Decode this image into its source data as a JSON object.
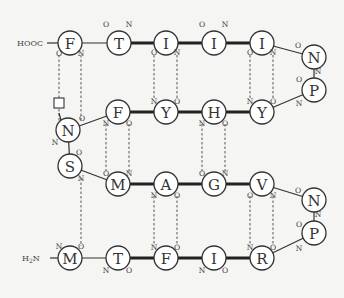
{
  "diagram": {
    "type": "beta-sheet-hydrogen-bond-map",
    "terminals": {
      "c_term": {
        "label": "HOOC",
        "attached_to": "r1"
      },
      "n_term": {
        "label": "H2N",
        "sub": "2",
        "attached_to": "r23"
      }
    },
    "residues": [
      {
        "id": "r1",
        "letter": "F",
        "x": 70,
        "y": 43
      },
      {
        "id": "r2",
        "letter": "T",
        "x": 119,
        "y": 43
      },
      {
        "id": "r3",
        "letter": "I",
        "x": 166,
        "y": 43
      },
      {
        "id": "r4",
        "letter": "I",
        "x": 214,
        "y": 43
      },
      {
        "id": "r5",
        "letter": "I",
        "x": 262,
        "y": 43
      },
      {
        "id": "r6",
        "letter": "N",
        "x": 314,
        "y": 57
      },
      {
        "id": "r7",
        "letter": "P",
        "x": 314,
        "y": 90
      },
      {
        "id": "r8",
        "letter": "Y",
        "x": 262,
        "y": 112
      },
      {
        "id": "r9",
        "letter": "H",
        "x": 214,
        "y": 112
      },
      {
        "id": "r10",
        "letter": "Y",
        "x": 166,
        "y": 112
      },
      {
        "id": "r11",
        "letter": "F",
        "x": 118,
        "y": 112
      },
      {
        "id": "r12",
        "letter": "N",
        "x": 68,
        "y": 130
      },
      {
        "id": "r13",
        "letter": "S",
        "x": 70,
        "y": 166
      },
      {
        "id": "r14",
        "letter": "M",
        "x": 118,
        "y": 184
      },
      {
        "id": "r15",
        "letter": "A",
        "x": 166,
        "y": 184
      },
      {
        "id": "r16",
        "letter": "G",
        "x": 214,
        "y": 184
      },
      {
        "id": "r17",
        "letter": "V",
        "x": 262,
        "y": 184
      },
      {
        "id": "r18",
        "letter": "N",
        "x": 314,
        "y": 200
      },
      {
        "id": "r19",
        "letter": "P",
        "x": 314,
        "y": 233
      },
      {
        "id": "r20",
        "letter": "R",
        "x": 262,
        "y": 258
      },
      {
        "id": "r21",
        "letter": "I",
        "x": 214,
        "y": 258
      },
      {
        "id": "r22",
        "letter": "F",
        "x": 166,
        "y": 258
      },
      {
        "id": "r23t",
        "letter": "T",
        "x": 118,
        "y": 258
      },
      {
        "id": "r23",
        "letter": "M",
        "x": 70,
        "y": 258
      }
    ],
    "backbone_bonds": [
      {
        "from": "r1",
        "to": "r2",
        "style": "thin"
      },
      {
        "from": "r2",
        "to": "r3",
        "style": "thick"
      },
      {
        "from": "r3",
        "to": "r4",
        "style": "thick"
      },
      {
        "from": "r4",
        "to": "r5",
        "style": "thick"
      },
      {
        "from": "r5",
        "to": "r6",
        "style": "thin"
      },
      {
        "from": "r6",
        "to": "r7",
        "style": "thin"
      },
      {
        "from": "r7",
        "to": "r8",
        "style": "thin"
      },
      {
        "from": "r8",
        "to": "r9",
        "style": "thick"
      },
      {
        "from": "r9",
        "to": "r10",
        "style": "thick"
      },
      {
        "from": "r10",
        "to": "r11",
        "style": "thick"
      },
      {
        "from": "r11",
        "to": "r12",
        "style": "thin"
      },
      {
        "from": "r12",
        "to": "r13",
        "style": "thin"
      },
      {
        "from": "r13",
        "to": "r14",
        "style": "thin"
      },
      {
        "from": "r14",
        "to": "r15",
        "style": "thick"
      },
      {
        "from": "r15",
        "to": "r16",
        "style": "thick"
      },
      {
        "from": "r16",
        "to": "r17",
        "style": "thick"
      },
      {
        "from": "r17",
        "to": "r18",
        "style": "thin"
      },
      {
        "from": "r18",
        "to": "r19",
        "style": "thin"
      },
      {
        "from": "r19",
        "to": "r20",
        "style": "thin"
      },
      {
        "from": "r20",
        "to": "r21",
        "style": "thick"
      },
      {
        "from": "r21",
        "to": "r22",
        "style": "thick"
      },
      {
        "from": "r22",
        "to": "r23t",
        "style": "thick"
      },
      {
        "from": "r23t",
        "to": "r23",
        "style": "thin"
      }
    ],
    "hydrogen_bonds": [
      {
        "x": 59,
        "y1": 55,
        "y2": 124,
        "note": "F(O) to square box"
      },
      {
        "x": 81,
        "y1": 55,
        "y2": 120
      },
      {
        "x": 154,
        "y1": 55,
        "y2": 100
      },
      {
        "x": 177,
        "y1": 55,
        "y2": 100
      },
      {
        "x": 250,
        "y1": 55,
        "y2": 100
      },
      {
        "x": 273,
        "y1": 55,
        "y2": 100
      },
      {
        "x": 106,
        "y1": 124,
        "y2": 172
      },
      {
        "x": 129,
        "y1": 124,
        "y2": 172
      },
      {
        "x": 202,
        "y1": 124,
        "y2": 172
      },
      {
        "x": 225,
        "y1": 124,
        "y2": 172
      },
      {
        "x": 81,
        "y1": 178,
        "y2": 246
      },
      {
        "x": 154,
        "y1": 196,
        "y2": 246
      },
      {
        "x": 177,
        "y1": 196,
        "y2": 246
      },
      {
        "x": 250,
        "y1": 196,
        "y2": 246
      },
      {
        "x": 273,
        "y1": 196,
        "y2": 246
      }
    ],
    "side_marker": {
      "shape": "square",
      "x": 59,
      "y": 103,
      "size": 10
    },
    "atom_labels": [
      {
        "t": "O",
        "x": 59,
        "y": 53
      },
      {
        "t": "N",
        "x": 81,
        "y": 53
      },
      {
        "t": "O",
        "x": 106,
        "y": 24
      },
      {
        "t": "N",
        "x": 129,
        "y": 24
      },
      {
        "t": "O",
        "x": 154,
        "y": 52
      },
      {
        "t": "N",
        "x": 177,
        "y": 52
      },
      {
        "t": "O",
        "x": 202,
        "y": 24
      },
      {
        "t": "N",
        "x": 225,
        "y": 24
      },
      {
        "t": "O",
        "x": 250,
        "y": 52
      },
      {
        "t": "N",
        "x": 273,
        "y": 52
      },
      {
        "t": "O",
        "x": 298,
        "y": 45
      },
      {
        "t": "N",
        "x": 318,
        "y": 71
      },
      {
        "t": "O",
        "x": 299,
        "y": 79
      },
      {
        "t": "N",
        "x": 299,
        "y": 103
      },
      {
        "t": "N",
        "x": 250,
        "y": 101
      },
      {
        "t": "O",
        "x": 273,
        "y": 101
      },
      {
        "t": "N",
        "x": 202,
        "y": 123
      },
      {
        "t": "O",
        "x": 225,
        "y": 123
      },
      {
        "t": "N",
        "x": 154,
        "y": 101
      },
      {
        "t": "O",
        "x": 177,
        "y": 101
      },
      {
        "t": "N",
        "x": 106,
        "y": 123
      },
      {
        "t": "O",
        "x": 129,
        "y": 123
      },
      {
        "t": "O",
        "x": 82,
        "y": 118
      },
      {
        "t": "N",
        "x": 55,
        "y": 142
      },
      {
        "t": "O",
        "x": 79,
        "y": 152
      },
      {
        "t": "N",
        "x": 81,
        "y": 178
      },
      {
        "t": "O",
        "x": 106,
        "y": 173
      },
      {
        "t": "N",
        "x": 129,
        "y": 173
      },
      {
        "t": "N",
        "x": 154,
        "y": 195
      },
      {
        "t": "O",
        "x": 177,
        "y": 195
      },
      {
        "t": "O",
        "x": 202,
        "y": 173
      },
      {
        "t": "N",
        "x": 225,
        "y": 173
      },
      {
        "t": "O",
        "x": 250,
        "y": 195
      },
      {
        "t": "N",
        "x": 273,
        "y": 195
      },
      {
        "t": "O",
        "x": 298,
        "y": 190
      },
      {
        "t": "N",
        "x": 318,
        "y": 214
      },
      {
        "t": "O",
        "x": 299,
        "y": 224
      },
      {
        "t": "N",
        "x": 299,
        "y": 248
      },
      {
        "t": "N",
        "x": 250,
        "y": 247
      },
      {
        "t": "O",
        "x": 273,
        "y": 247
      },
      {
        "t": "N",
        "x": 202,
        "y": 270
      },
      {
        "t": "O",
        "x": 225,
        "y": 270
      },
      {
        "t": "N",
        "x": 154,
        "y": 247
      },
      {
        "t": "O",
        "x": 177,
        "y": 247
      },
      {
        "t": "N",
        "x": 106,
        "y": 270
      },
      {
        "t": "O",
        "x": 129,
        "y": 270
      },
      {
        "t": "N",
        "x": 59,
        "y": 246
      },
      {
        "t": "O",
        "x": 81,
        "y": 246
      }
    ]
  }
}
